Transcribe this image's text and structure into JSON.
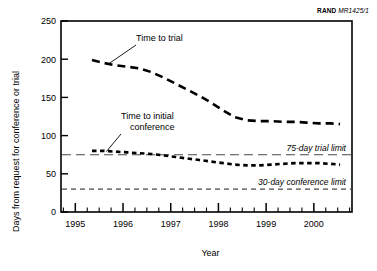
{
  "credit": {
    "brand": "RAND",
    "code": "MR1425/1"
  },
  "chart_data": {
    "type": "line",
    "title": "",
    "xlabel": "Year",
    "ylabel": "Days from request for conference or trial",
    "xlim": [
      1994.7,
      2000.8
    ],
    "ylim": [
      0,
      250
    ],
    "yticks": [
      0,
      50,
      100,
      150,
      200,
      250
    ],
    "ytick_labels": [
      "0",
      "50",
      "100",
      "150",
      "200",
      "250"
    ],
    "xticks": [
      1995,
      1996,
      1997,
      1998,
      1999,
      2000
    ],
    "xtick_labels": [
      "1995",
      "1996",
      "1997",
      "1998",
      "1999",
      "2000"
    ],
    "minor_xtick_interval": 0.25,
    "grid": false,
    "legend": "annotations",
    "series": [
      {
        "name": "Time to trial",
        "style": "long-dashed",
        "x": [
          1995.35,
          1995.6,
          1995.85,
          1996.1,
          1996.35,
          1996.6,
          1996.85,
          1997.1,
          1997.35,
          1997.6,
          1997.85,
          1998.1,
          1998.35,
          1998.6,
          1998.85,
          1999.1,
          1999.35,
          1999.6,
          1999.85,
          2000.1,
          2000.35,
          2000.55
        ],
        "y": [
          199,
          195,
          192,
          190,
          188,
          183,
          176,
          168,
          160,
          152,
          143,
          133,
          124,
          120,
          119,
          119,
          118,
          118,
          117,
          116,
          116,
          115
        ]
      },
      {
        "name": "Time to initial conference",
        "style": "short-dashed",
        "x": [
          1995.35,
          1995.6,
          1995.85,
          1996.1,
          1996.35,
          1996.6,
          1996.85,
          1997.1,
          1997.35,
          1997.6,
          1997.85,
          1998.1,
          1998.35,
          1998.6,
          1998.85,
          1999.1,
          1999.35,
          1999.6,
          1999.85,
          2000.1,
          2000.35,
          2000.55
        ],
        "y": [
          80,
          80,
          79,
          78,
          77,
          76,
          74,
          72,
          70,
          68,
          66,
          64,
          62,
          61,
          61,
          62,
          63,
          64,
          64,
          64,
          63,
          62
        ]
      }
    ],
    "reference_lines": [
      {
        "label": "75-day trial limit",
        "value": 75,
        "style": "long-dashed"
      },
      {
        "label": "30-day conference limit",
        "value": 30,
        "style": "short-dashed"
      }
    ],
    "annotations": [
      {
        "label": "Time to trial",
        "target_x": 1995.7,
        "target_y": 194
      },
      {
        "label_line1": "Time to initial",
        "label_line2": "conference",
        "target_x": 1995.65,
        "target_y": 79
      }
    ]
  }
}
